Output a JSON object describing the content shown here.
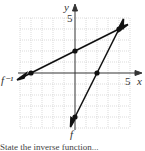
{
  "figure": {
    "axes": {
      "x_label": "x",
      "y_label": "y",
      "x_tick_label": "5",
      "y_tick_label": "5",
      "xlim": [
        -5,
        5
      ],
      "ylim": [
        -5,
        5
      ]
    },
    "curves": [
      {
        "name": "f⁻¹",
        "label": "f⁻¹",
        "points": [
          [
            -4,
            0
          ],
          [
            0,
            2
          ],
          [
            4,
            4
          ]
        ]
      },
      {
        "name": "f",
        "label": "f",
        "points": [
          [
            0,
            -4
          ],
          [
            2,
            0
          ],
          [
            4,
            4
          ]
        ]
      }
    ],
    "colors": {
      "grid": "#bbbbbb",
      "line": "#222222",
      "axis": "#333333"
    }
  },
  "caption": "State the inverse function..."
}
